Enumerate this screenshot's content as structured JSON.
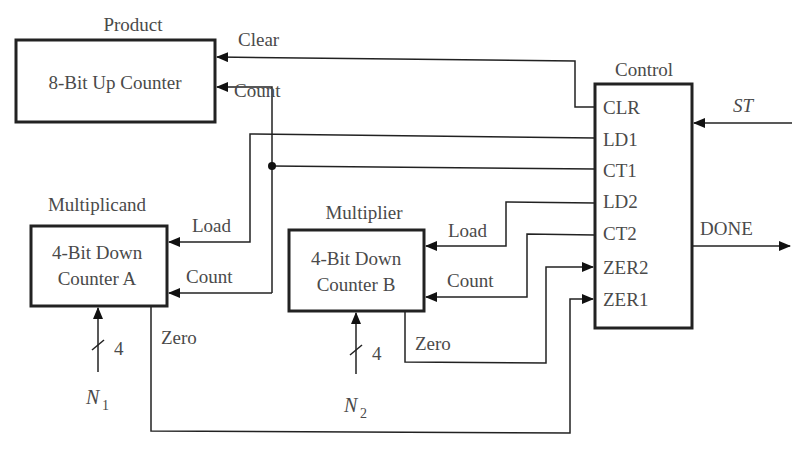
{
  "blocks": {
    "product": {
      "title": "Product",
      "body": "8-Bit Up Counter"
    },
    "control": {
      "title": "Control",
      "pins": [
        "CLR",
        "LD1",
        "CT1",
        "LD2",
        "CT2",
        "ZER2",
        "ZER1"
      ]
    },
    "counter_a": {
      "title": "Multiplicand",
      "line1": "4-Bit Down",
      "line2": "Counter A"
    },
    "counter_b": {
      "title": "Multiplier",
      "line1": "4-Bit Down",
      "line2": "Counter B"
    }
  },
  "signals": {
    "clear": "Clear",
    "count_product": "Count",
    "load_a": "Load",
    "count_a": "Count",
    "load_b": "Load",
    "count_b": "Count",
    "zero_a": "Zero",
    "zero_b": "Zero",
    "st": "ST",
    "done": "DONE",
    "bus_width_a": "4",
    "bus_width_b": "4",
    "n1": "N",
    "n1_sub": "1",
    "n2": "N",
    "n2_sub": "2"
  }
}
